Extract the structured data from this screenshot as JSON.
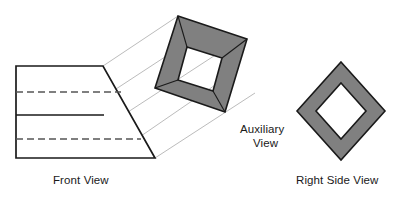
{
  "figure": {
    "background_color": "#ffffff",
    "line_color": "#1a1a1a",
    "projection_line_color": "#b3b3b3",
    "fill_gray": "#808080",
    "fill_white": "#ffffff"
  },
  "labels": {
    "front_view": "Front View",
    "auxiliary_view_line1": "Auxiliary",
    "auxiliary_view_line2": "View",
    "right_side_view": "Right Side View"
  },
  "front_view": {
    "name": "Front View",
    "outline_points": "16,66 103,66 155,158 16,158",
    "solid_divider": "16,115 104,115",
    "hidden_lines": [
      "16,92 121,92",
      "16,139 141,139"
    ]
  },
  "projection_lines": [
    "103,66 178,16",
    "116,89 200,34",
    "128,112 220,52",
    "141,136 237,70",
    "155,158 255,93"
  ],
  "auxiliary_view": {
    "name": "Auxiliary View",
    "outer_points": "178,16 247,39 225,112 155,88",
    "inner_points": "187,47 222,58 213,91 178,80",
    "inner_fold_lines": [
      "187,47 178,16",
      "222,58 247,39",
      "213,91 225,112",
      "178,80 155,88"
    ]
  },
  "right_side_view": {
    "name": "Right Side View",
    "outer_points": "341,62 385,111 341,160 297,111",
    "inner_points": "341,83 366,111 341,139 316,111"
  },
  "label_positions": {
    "front_view": {
      "x": 53,
      "y": 184
    },
    "auxiliary_view_line1": {
      "x": 240,
      "y": 133
    },
    "auxiliary_view_line2": {
      "x": 253,
      "y": 147
    },
    "right_side_view": {
      "x": 296,
      "y": 184
    }
  }
}
